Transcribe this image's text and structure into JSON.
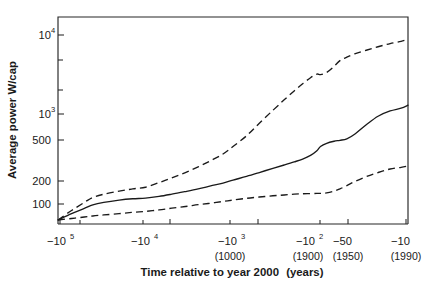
{
  "chart_data": {
    "type": "line",
    "title": "",
    "xlabel": "Time relative to year 2000 (years)",
    "xlabel_main": "Time relative to year 2000",
    "xlabel_unit": "(years)",
    "ylabel": "Average power W/cap",
    "xscale": "log-reversed",
    "yscale": "log",
    "grid": false,
    "legend": "none",
    "xlim": [
      -100000,
      -10
    ],
    "ylim": [
      90,
      20000
    ],
    "x_tick_labels": [
      {
        "label": "−10",
        "exp": "5",
        "sub": "",
        "value": -100000
      },
      {
        "label": "−10",
        "exp": "4",
        "sub": "",
        "value": -10000
      },
      {
        "label": "−10",
        "exp": "3",
        "sub": "(1000)",
        "value": -1000
      },
      {
        "label": "−10",
        "exp": "2",
        "sub": "(1900)",
        "value": -100
      },
      {
        "label": "−50",
        "exp": "",
        "sub": "(1950)",
        "value": -50
      },
      {
        "label": "−10",
        "exp": "",
        "sub": "(1990)",
        "value": -10
      }
    ],
    "y_tick_labels": [
      {
        "label": "10",
        "exp": "4",
        "value": 10000
      },
      {
        "label": "",
        "exp": "",
        "value": 5000
      },
      {
        "label": "",
        "exp": "",
        "value": 2000
      },
      {
        "label": "10",
        "exp": "3",
        "value": 1000
      },
      {
        "label": "500",
        "exp": "",
        "value": 500
      },
      {
        "label": "200",
        "exp": "",
        "value": 200
      },
      {
        "label": "100",
        "exp": "",
        "value": 100
      }
    ],
    "series": [
      {
        "name": "upper-bound",
        "style": "dashed",
        "points": [
          [
            -100000,
            100
          ],
          [
            -70000,
            128
          ],
          [
            -50000,
            158
          ],
          [
            -40000,
            180
          ],
          [
            -30000,
            196
          ],
          [
            -20000,
            212
          ],
          [
            -14000,
            225
          ],
          [
            -10000,
            235
          ],
          [
            -7000,
            265
          ],
          [
            -5000,
            300
          ],
          [
            -3500,
            345
          ],
          [
            -2500,
            400
          ],
          [
            -1800,
            470
          ],
          [
            -1300,
            560
          ],
          [
            -1000,
            680
          ],
          [
            -700,
            900
          ],
          [
            -500,
            1250
          ],
          [
            -350,
            1750
          ],
          [
            -260,
            2300
          ],
          [
            -200,
            2900
          ],
          [
            -160,
            3500
          ],
          [
            -130,
            4100
          ],
          [
            -110,
            4500
          ],
          [
            -100,
            4450
          ],
          [
            -85,
            4700
          ],
          [
            -70,
            5500
          ],
          [
            -60,
            6400
          ],
          [
            -50,
            7000
          ],
          [
            -40,
            7700
          ],
          [
            -30,
            8400
          ],
          [
            -22,
            9200
          ],
          [
            -16,
            10000
          ],
          [
            -12,
            10600
          ],
          [
            -10,
            11200
          ]
        ]
      },
      {
        "name": "central-estimate",
        "style": "solid",
        "points": [
          [
            -100000,
            100
          ],
          [
            -70000,
            118
          ],
          [
            -50000,
            135
          ],
          [
            -40000,
            148
          ],
          [
            -30000,
            158
          ],
          [
            -20000,
            168
          ],
          [
            -14000,
            174
          ],
          [
            -10000,
            177
          ],
          [
            -7000,
            185
          ],
          [
            -5000,
            196
          ],
          [
            -3500,
            210
          ],
          [
            -2500,
            225
          ],
          [
            -1800,
            243
          ],
          [
            -1300,
            262
          ],
          [
            -1000,
            283
          ],
          [
            -700,
            312
          ],
          [
            -500,
            345
          ],
          [
            -350,
            385
          ],
          [
            -260,
            420
          ],
          [
            -200,
            455
          ],
          [
            -160,
            490
          ],
          [
            -130,
            540
          ],
          [
            -110,
            610
          ],
          [
            -100,
            680
          ],
          [
            -85,
            740
          ],
          [
            -70,
            780
          ],
          [
            -60,
            800
          ],
          [
            -50,
            830
          ],
          [
            -40,
            950
          ],
          [
            -30,
            1200
          ],
          [
            -22,
            1500
          ],
          [
            -16,
            1720
          ],
          [
            -12,
            1850
          ],
          [
            -10,
            2000
          ]
        ]
      },
      {
        "name": "lower-bound",
        "style": "dashed",
        "points": [
          [
            -100000,
            100
          ],
          [
            -70000,
            104
          ],
          [
            -50000,
            108
          ],
          [
            -40000,
            111
          ],
          [
            -30000,
            114
          ],
          [
            -20000,
            118
          ],
          [
            -14000,
            122
          ],
          [
            -10000,
            125
          ],
          [
            -7000,
            130
          ],
          [
            -5000,
            136
          ],
          [
            -3500,
            142
          ],
          [
            -2500,
            149
          ],
          [
            -1800,
            155
          ],
          [
            -1300,
            162
          ],
          [
            -1000,
            168
          ],
          [
            -700,
            176
          ],
          [
            -500,
            182
          ],
          [
            -350,
            188
          ],
          [
            -260,
            192
          ],
          [
            -200,
            196
          ],
          [
            -160,
            198
          ],
          [
            -130,
            199
          ],
          [
            -110,
            200
          ],
          [
            -100,
            200
          ],
          [
            -85,
            203
          ],
          [
            -70,
            212
          ],
          [
            -60,
            225
          ],
          [
            -50,
            245
          ],
          [
            -40,
            275
          ],
          [
            -30,
            310
          ],
          [
            -22,
            345
          ],
          [
            -16,
            378
          ],
          [
            -12,
            395
          ],
          [
            -10,
            410
          ]
        ]
      }
    ]
  }
}
